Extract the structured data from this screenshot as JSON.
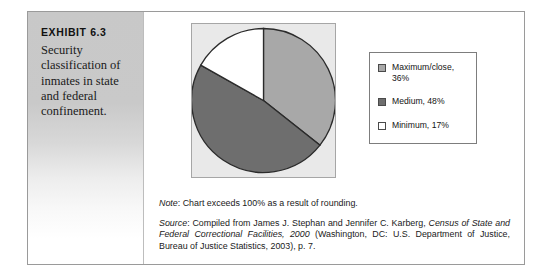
{
  "exhibit": {
    "label": "EXHIBIT 6.3",
    "caption": "Security classification of inmates in state and federal confinement."
  },
  "chart_data": {
    "type": "pie",
    "title": "",
    "categories": [
      "Maximum/close",
      "Medium",
      "Minimum"
    ],
    "values": [
      36,
      48,
      17
    ],
    "value_labels": [
      "36%",
      "48%",
      "17%"
    ],
    "legend_entries": [
      {
        "label": "Maximum/close, 36%",
        "swatch_name": "swatch-maximum-close",
        "color": "#a8a8a8",
        "value": 36
      },
      {
        "label": "Medium, 48%",
        "swatch_name": "swatch-medium",
        "color": "#6e6e6e",
        "value": 48
      },
      {
        "label": "Minimum, 17%",
        "swatch_name": "swatch-minimum",
        "color": "#ffffff",
        "value": 17
      }
    ],
    "legend_position": "right",
    "grid": false,
    "plot_background": "#e9e9e9",
    "slice_outline": "#2b2b2b",
    "start_angle_deg": 0,
    "direction": "clockwise"
  },
  "note": {
    "lead": "Note",
    "text": ": Chart exceeds 100% as a result of rounding."
  },
  "source": {
    "lead": "Source",
    "part1": ": Compiled from James J. Stephan and Jennifer C. Karberg, ",
    "work_title": "Census of State and Federal Correctional Facilities, 2000",
    "part2": " (Washington, DC: U.S. Department of Justice, Bureau of Justice Statistics, 2003), p. 7."
  }
}
